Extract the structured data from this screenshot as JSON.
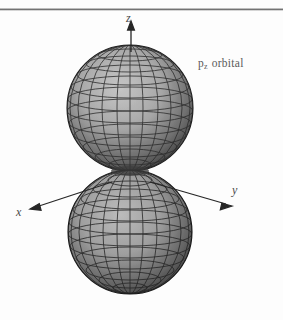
{
  "figure": {
    "background_color": "#fdfdfd",
    "rule_color": "#6f6f6f",
    "caption": {
      "symbol": "p",
      "subscript": "z",
      "word": "orbital",
      "color": "#5a5a5a"
    },
    "axes": {
      "z_label": "z",
      "x_label": "x",
      "y_label": "y",
      "color": "#2c2c2c"
    },
    "orbital": {
      "type": "p-orbital",
      "lobes": 2,
      "mesh_line_color": "#2b2b2b",
      "surface_light_color": "#b9b9b9",
      "surface_dark_color": "#4a4a4a",
      "upper_lobe": {
        "center_x": 130,
        "center_y": 108,
        "radius": 63
      },
      "lower_lobe": {
        "center_x": 130,
        "center_y": 232,
        "radius": 62
      },
      "meridians": 24,
      "parallels": 12
    }
  }
}
